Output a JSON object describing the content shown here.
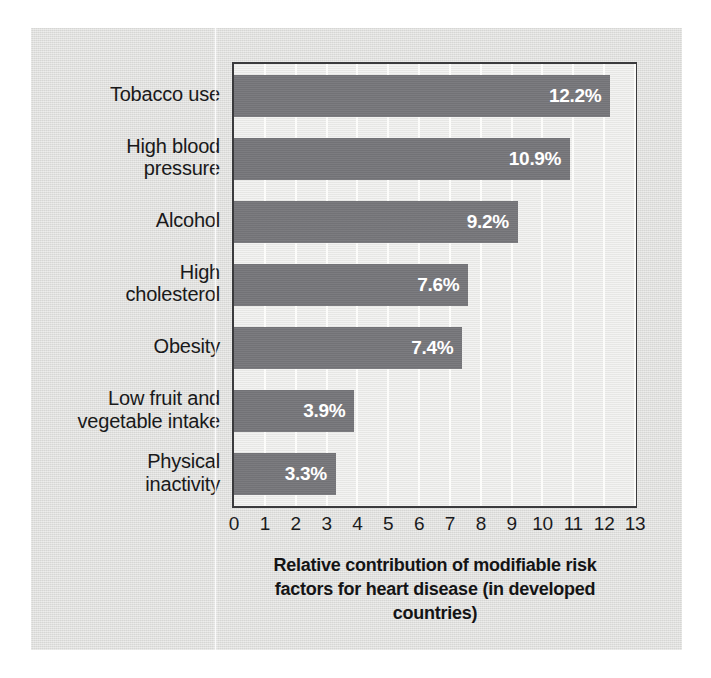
{
  "chart_data": {
    "type": "bar",
    "orientation": "horizontal",
    "title_lines": [
      "Relative contribution of modifiable risk",
      "factors for heart disease (in developed",
      "countries)"
    ],
    "xlabel": "",
    "ylabel": "",
    "xlim": [
      0,
      13
    ],
    "grid": true,
    "grid_axis": "x",
    "legend": "none",
    "categories": [
      "Tobacco use",
      "High blood\npressure",
      "Alcohol",
      "High\ncholesterol",
      "Obesity",
      "Low fruit and\nvegetable intake",
      "Physical\ninactivity"
    ],
    "values": [
      12.2,
      10.9,
      9.2,
      7.6,
      7.4,
      3.9,
      3.3
    ],
    "data_labels": [
      "12.2%",
      "10.9%",
      "9.2%",
      "7.6%",
      "7.4%",
      "3.9%",
      "3.3%"
    ],
    "xticks": [
      0,
      1,
      2,
      3,
      4,
      5,
      6,
      7,
      8,
      9,
      10,
      11,
      12,
      13
    ],
    "xtick_labels": [
      "0",
      "1",
      "2",
      "3",
      "4",
      "5",
      "6",
      "7",
      "8",
      "9",
      "10",
      "11",
      "12",
      "13"
    ],
    "colors": {
      "bar": "#76767a",
      "plot_background": "#e9e9e7",
      "page_background": "#dededc",
      "gridline": "#fcfcfa",
      "axis_border": "#3a3a3c",
      "data_label_text": "#ffffff",
      "text": "#19191a"
    }
  }
}
